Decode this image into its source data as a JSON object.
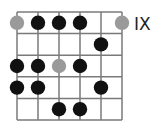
{
  "diagram": {
    "type": "guitar-scale-box",
    "position_label": "IX",
    "strings": 6,
    "frets": 5,
    "colors": {
      "line": "#7a7a7a",
      "note": "#111111",
      "root": "#9a9a9a"
    },
    "notes": [
      {
        "string": 0,
        "fret": 1,
        "kind": "root"
      },
      {
        "string": 1,
        "fret": 1,
        "kind": "note"
      },
      {
        "string": 2,
        "fret": 1,
        "kind": "note"
      },
      {
        "string": 3,
        "fret": 1,
        "kind": "note"
      },
      {
        "string": 5,
        "fret": 1,
        "kind": "root"
      },
      {
        "string": 4,
        "fret": 2,
        "kind": "note"
      },
      {
        "string": 0,
        "fret": 3,
        "kind": "note"
      },
      {
        "string": 1,
        "fret": 3,
        "kind": "note"
      },
      {
        "string": 2,
        "fret": 3,
        "kind": "root"
      },
      {
        "string": 3,
        "fret": 3,
        "kind": "note"
      },
      {
        "string": 0,
        "fret": 4,
        "kind": "note"
      },
      {
        "string": 1,
        "fret": 4,
        "kind": "note"
      },
      {
        "string": 4,
        "fret": 4,
        "kind": "note"
      },
      {
        "string": 2,
        "fret": 5,
        "kind": "note"
      },
      {
        "string": 3,
        "fret": 5,
        "kind": "note"
      }
    ]
  }
}
